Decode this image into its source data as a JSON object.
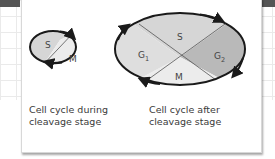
{
  "colors": {
    "phase_s": "#d6d6d6",
    "phase_m": "#ececec",
    "phase_g1": "#dedede",
    "phase_g2": "#b9b9b9",
    "outline": "#1a1a1a",
    "divider": "#555555",
    "text": "#3a3a3a"
  },
  "left_diagram": {
    "phases": [
      {
        "id": "S",
        "label": "S"
      },
      {
        "id": "M",
        "label": "M"
      }
    ],
    "caption": {
      "line1": "Cell cycle during",
      "line2": "cleavage stage"
    }
  },
  "right_diagram": {
    "phases": [
      {
        "id": "G1",
        "label": "G",
        "subscript": "1"
      },
      {
        "id": "S",
        "label": "S"
      },
      {
        "id": "G2",
        "label": "G",
        "subscript": "2"
      },
      {
        "id": "M",
        "label": "M"
      }
    ],
    "caption": {
      "line1": "Cell cycle after",
      "line2": "cleavage stage"
    }
  }
}
